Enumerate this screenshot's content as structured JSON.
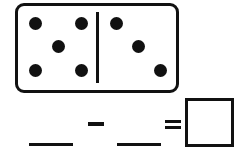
{
  "worksheet": {
    "domino": {
      "left_half_pips": 5,
      "right_half_pips": 3,
      "left_dots": [
        [
          35,
          23
        ],
        [
          81,
          23
        ],
        [
          58,
          46
        ],
        [
          35,
          70
        ],
        [
          81,
          70
        ]
      ],
      "right_dots": [
        [
          116,
          23
        ],
        [
          138,
          46
        ],
        [
          160,
          70
        ]
      ]
    },
    "equation": {
      "operand_1": "",
      "operator": "-",
      "operand_2": "",
      "equals": "=",
      "answer": ""
    },
    "colors": {
      "ink": "#111111",
      "background": "#ffffff"
    }
  }
}
